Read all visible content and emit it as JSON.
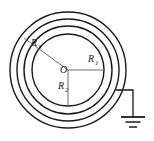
{
  "figure": {
    "type": "technical-line-drawing",
    "colors": {
      "stroke": "#1a1a1a",
      "thin_stroke": "#6a6a6a",
      "background": "#ffffff"
    },
    "center": {
      "label": "O",
      "x": 68,
      "y": 70
    },
    "circles": [
      {
        "name": "innermost-circle",
        "radius": 36,
        "stroke_width": 1.4
      },
      {
        "name": "second-circle",
        "radius": 44,
        "stroke_width": 1.4
      },
      {
        "name": "third-circle",
        "radius": 51,
        "stroke_width": 1.4
      },
      {
        "name": "outermost-circle",
        "radius": 58,
        "stroke_width": 1.4
      }
    ],
    "radii": [
      {
        "name": "radius-r1",
        "label": "R",
        "subscript": "1",
        "direction": "right-horizontal",
        "label_x": 88,
        "label_y": 62,
        "end_x": 104,
        "end_y": 70
      },
      {
        "name": "radius-r2",
        "label": "R",
        "subscript": "2",
        "direction": "down-vertical",
        "label_x": 62,
        "label_y": 88,
        "end_x": 68,
        "end_y": 106
      },
      {
        "name": "radius-r3",
        "label": "R",
        "subscript": "3",
        "direction": "upper-left-oblique",
        "label_x": 35,
        "label_y": 45,
        "end_x": 24,
        "end_y": 38
      }
    ],
    "ground": {
      "name": "earth-ground-symbol",
      "wire_start_x": 116,
      "wire_start_y": 90,
      "wire_corner_x": 133,
      "wire_corner_y": 90,
      "wire_end_y": 117,
      "bars": [
        {
          "half_width": 12,
          "y": 117,
          "thickness": 1.6
        },
        {
          "half_width": 7.5,
          "y": 122,
          "thickness": 1.4
        },
        {
          "half_width": 4,
          "y": 127,
          "thickness": 1.4
        }
      ]
    }
  }
}
